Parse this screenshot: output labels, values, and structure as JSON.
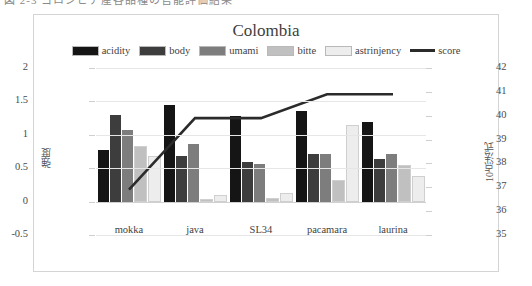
{
  "page": {
    "top_fragment": "図 2-3 コロンビア産各品種の官能評価結果"
  },
  "chart_data": {
    "type": "bar",
    "title": "Colombia",
    "categories": [
      "mokka",
      "java",
      "SL34",
      "pacamara",
      "laurina"
    ],
    "series": [
      {
        "name": "acidity",
        "values": [
          0.77,
          1.45,
          1.28,
          1.35,
          1.19
        ],
        "color": "#151515"
      },
      {
        "name": "body",
        "values": [
          1.3,
          0.68,
          0.6,
          0.72,
          0.64
        ],
        "color": "#3d3d3d"
      },
      {
        "name": "umami",
        "values": [
          1.07,
          0.87,
          0.57,
          0.72,
          0.72
        ],
        "color": "#7d7d7d"
      },
      {
        "name": "bitte",
        "values": [
          0.8,
          0.01,
          0.02,
          0.3,
          0.52
        ],
        "color": "#c0c0c0"
      },
      {
        "name": "astrinjency",
        "values": [
          0.65,
          0.07,
          0.1,
          1.12,
          0.35
        ],
        "color": "#ededed"
      }
    ],
    "line_series": {
      "name": "score",
      "values": [
        36.9,
        39.9,
        39.9,
        40.9,
        40.9
      ],
      "color": "#2b2b2b"
    },
    "ylabel_left": "強度",
    "ylabel_right": "10点法式",
    "ylim_left": [
      -0.5,
      2
    ],
    "ylim_right": [
      35,
      42
    ],
    "yticks_left": [
      "2",
      "1.5",
      "1",
      "0.5",
      "0",
      "-0.5"
    ],
    "yticks_right": [
      "42",
      "41",
      "40",
      "39",
      "38",
      "37",
      "36",
      "35"
    ],
    "grid": true,
    "legend_position": "top"
  }
}
